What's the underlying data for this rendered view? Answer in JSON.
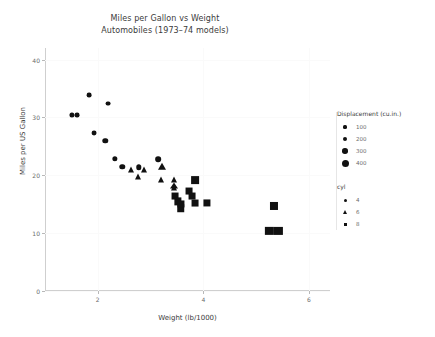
{
  "chart_data": {
    "type": "scatter",
    "title": "Miles per Gallon vs Weight",
    "subtitle": "Automobiles (1973–74 models)",
    "xlabel": "Weight (lb/1000)",
    "ylabel": "Miles per US Gallon",
    "xlim": [
      1.0,
      6.4
    ],
    "ylim": [
      0,
      42
    ],
    "xticks": [
      2,
      4,
      6
    ],
    "yticks": [
      0,
      10,
      20,
      30,
      40
    ],
    "grid": true,
    "legend_position": "right",
    "size_encoding": "Displacement (cu.in.)",
    "shape_encoding": "cyl",
    "points": [
      {
        "x": 1.513,
        "y": 30.4,
        "disp": 95,
        "cyl": 4,
        "shape": "circle"
      },
      {
        "x": 1.615,
        "y": 30.4,
        "disp": 75,
        "cyl": 4,
        "shape": "circle"
      },
      {
        "x": 1.835,
        "y": 33.9,
        "disp": 71,
        "cyl": 4,
        "shape": "circle"
      },
      {
        "x": 1.935,
        "y": 27.3,
        "disp": 79,
        "cyl": 4,
        "shape": "circle"
      },
      {
        "x": 2.14,
        "y": 26.0,
        "disp": 120,
        "cyl": 4,
        "shape": "circle"
      },
      {
        "x": 2.2,
        "y": 32.4,
        "disp": 78,
        "cyl": 4,
        "shape": "circle"
      },
      {
        "x": 2.32,
        "y": 22.8,
        "disp": 108,
        "cyl": 4,
        "shape": "circle"
      },
      {
        "x": 2.465,
        "y": 21.5,
        "disp": 120,
        "cyl": 4,
        "shape": "circle"
      },
      {
        "x": 2.62,
        "y": 21.0,
        "disp": 160,
        "cyl": 6,
        "shape": "triangle"
      },
      {
        "x": 2.77,
        "y": 19.7,
        "disp": 145,
        "cyl": 6,
        "shape": "triangle"
      },
      {
        "x": 2.78,
        "y": 21.4,
        "disp": 121,
        "cyl": 4,
        "shape": "circle"
      },
      {
        "x": 2.875,
        "y": 21.0,
        "disp": 160,
        "cyl": 6,
        "shape": "triangle"
      },
      {
        "x": 3.15,
        "y": 22.8,
        "disp": 141,
        "cyl": 6,
        "shape": "circle"
      },
      {
        "x": 3.19,
        "y": 19.2,
        "disp": 168,
        "cyl": 6,
        "shape": "triangle"
      },
      {
        "x": 3.215,
        "y": 21.4,
        "disp": 258,
        "cyl": 6,
        "shape": "triangle"
      },
      {
        "x": 3.44,
        "y": 18.1,
        "disp": 225,
        "cyl": 6,
        "shape": "triangle"
      },
      {
        "x": 3.44,
        "y": 17.8,
        "disp": 168,
        "cyl": 6,
        "shape": "triangle"
      },
      {
        "x": 3.44,
        "y": 19.2,
        "disp": 168,
        "cyl": 6,
        "shape": "triangle"
      },
      {
        "x": 3.46,
        "y": 16.4,
        "disp": 276,
        "cyl": 8,
        "shape": "square"
      },
      {
        "x": 3.52,
        "y": 15.5,
        "disp": 318,
        "cyl": 8,
        "shape": "square"
      },
      {
        "x": 3.57,
        "y": 14.3,
        "disp": 360,
        "cyl": 8,
        "shape": "square"
      },
      {
        "x": 3.57,
        "y": 15.0,
        "disp": 301,
        "cyl": 8,
        "shape": "square"
      },
      {
        "x": 3.73,
        "y": 17.3,
        "disp": 275,
        "cyl": 8,
        "shape": "square"
      },
      {
        "x": 3.78,
        "y": 16.4,
        "disp": 275,
        "cyl": 8,
        "shape": "square"
      },
      {
        "x": 3.84,
        "y": 15.2,
        "disp": 275,
        "cyl": 8,
        "shape": "square"
      },
      {
        "x": 3.845,
        "y": 19.2,
        "disp": 400,
        "cyl": 8,
        "shape": "square"
      },
      {
        "x": 4.07,
        "y": 15.2,
        "disp": 304,
        "cyl": 8,
        "shape": "square"
      },
      {
        "x": 5.25,
        "y": 10.4,
        "disp": 472,
        "cyl": 8,
        "shape": "square"
      },
      {
        "x": 5.345,
        "y": 14.7,
        "disp": 440,
        "cyl": 8,
        "shape": "square"
      },
      {
        "x": 5.424,
        "y": 10.4,
        "disp": 460,
        "cyl": 8,
        "shape": "square"
      }
    ]
  },
  "legends": {
    "size": {
      "title": "Displacement (cu.in.)",
      "entries": [
        {
          "label": "100",
          "px": 3.2
        },
        {
          "label": "200",
          "px": 4.4
        },
        {
          "label": "300",
          "px": 5.6
        },
        {
          "label": "400",
          "px": 7.0
        }
      ]
    },
    "shape": {
      "title": "cyl",
      "entries": [
        {
          "label": "4",
          "shape": "circle"
        },
        {
          "label": "6",
          "shape": "triangle"
        },
        {
          "label": "8",
          "shape": "square"
        }
      ]
    }
  }
}
